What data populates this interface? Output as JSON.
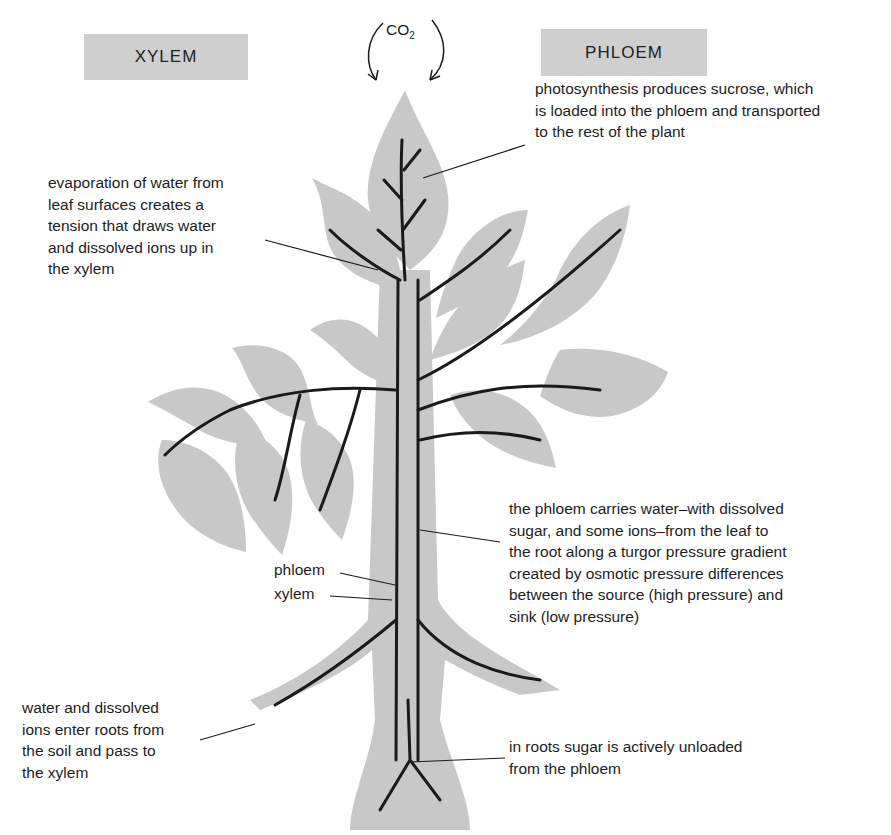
{
  "headers": {
    "xylem": "XYLEM",
    "phloem": "PHLOEM"
  },
  "co2": {
    "base": "CO",
    "subscript": "2"
  },
  "annotations": {
    "photosynthesis": "photosynthesis produces sucrose, which\nis loaded into the phloem and transported\nto the rest of the plant",
    "evaporation": "evaporation of water from\nleaf surfaces creates a\ntension that draws water\nand dissolved ions up in\nthe xylem",
    "phloem_transport": "the phloem carries water–with dissolved\nsugar, and some ions–from the leaf to\nthe root along a turgor pressure gradient\ncreated by osmotic pressure differences\nbetween the source (high pressure) and\nsink (low pressure)",
    "roots_entry": "water and dissolved\nions enter roots from\nthe soil and pass to\nthe xylem",
    "roots_unload": "in roots sugar is actively unloaded\nfrom the phloem"
  },
  "labels": {
    "phloem": "phloem",
    "xylem": "xylem"
  },
  "colors": {
    "header_bg": "#cfcfcf",
    "leaf_fill": "#c8c8c8",
    "vein": "#1a1a1a",
    "background": "#ffffff"
  }
}
